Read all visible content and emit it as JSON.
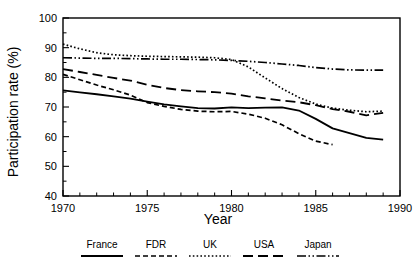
{
  "chart_data": {
    "type": "line",
    "title": "",
    "xlabel": "Year",
    "ylabel": "Participation rate (%)",
    "xlim": [
      1970,
      1990
    ],
    "ylim": [
      40,
      100
    ],
    "grid": false,
    "legend_position": "bottom",
    "x_major_ticks": [
      1970,
      1975,
      1980,
      1985,
      1990
    ],
    "x_major_tick_labels": [
      "1970",
      "1975",
      "1980",
      "1985",
      "1990"
    ],
    "x_minor_tick_step": 1,
    "y_major_ticks": [
      40,
      50,
      60,
      70,
      80,
      90,
      100
    ],
    "y_major_tick_labels": [
      "40",
      "50",
      "60",
      "70",
      "80",
      "90",
      "100"
    ],
    "y_minor_tick_step": 5,
    "series": [
      {
        "name": "France",
        "dash_style": "solid",
        "stroke_width": 1.8,
        "dasharray": "",
        "x": [
          1970,
          1971,
          1972,
          1973,
          1974,
          1975,
          1976,
          1977,
          1978,
          1979,
          1980,
          1981,
          1982,
          1983,
          1984,
          1985,
          1986,
          1987,
          1988,
          1989
        ],
        "values": [
          75.6,
          74.9,
          74.3,
          73.6,
          72.8,
          71.8,
          70.9,
          70.2,
          69.6,
          69.5,
          69.9,
          69.6,
          69.8,
          69.9,
          68.8,
          66.0,
          62.8,
          61.2,
          59.6,
          59.0
        ]
      },
      {
        "name": "FDR",
        "dash_style": "short-dash",
        "stroke_width": 1.7,
        "dasharray": "5,3",
        "x": [
          1970,
          1971,
          1972,
          1973,
          1974,
          1975,
          1976,
          1977,
          1978,
          1979,
          1980,
          1981,
          1982,
          1983,
          1984,
          1985,
          1986
        ],
        "values": [
          81.0,
          79.2,
          77.4,
          75.8,
          74.0,
          71.5,
          70.2,
          69.2,
          68.6,
          68.4,
          68.5,
          67.6,
          66.2,
          64.0,
          61.0,
          58.5,
          57.3
        ]
      },
      {
        "name": "UK",
        "dash_style": "dotted",
        "stroke_width": 1.7,
        "dasharray": "1.6,2.2",
        "x": [
          1970,
          1971,
          1972,
          1973,
          1974,
          1975,
          1976,
          1977,
          1978,
          1979,
          1980,
          1981,
          1982,
          1983,
          1984,
          1985,
          1986,
          1987,
          1988,
          1989
        ],
        "values": [
          91.2,
          89.6,
          88.3,
          87.6,
          87.3,
          87.1,
          87.0,
          86.9,
          86.8,
          86.6,
          86.0,
          83.5,
          79.8,
          76.2,
          73.2,
          71.0,
          69.6,
          68.9,
          68.4,
          68.6
        ]
      },
      {
        "name": "USA",
        "dash_style": "long-dash",
        "stroke_width": 1.8,
        "dasharray": "10,5",
        "x": [
          1970,
          1971,
          1972,
          1973,
          1974,
          1975,
          1976,
          1977,
          1978,
          1979,
          1980,
          1981,
          1982,
          1983,
          1984,
          1985,
          1986,
          1987,
          1988,
          1989
        ],
        "values": [
          82.8,
          81.8,
          80.8,
          79.8,
          78.9,
          77.5,
          76.4,
          75.7,
          75.3,
          75.0,
          74.5,
          73.6,
          72.9,
          72.2,
          71.6,
          70.6,
          69.3,
          68.4,
          67.2,
          68.0
        ]
      },
      {
        "name": "Japan",
        "dash_style": "dash-dot-dot",
        "stroke_width": 1.7,
        "dasharray": "9,2.5,1.5,2.5,1.5,2.5",
        "x": [
          1970,
          1971,
          1972,
          1973,
          1974,
          1975,
          1976,
          1977,
          1978,
          1979,
          1980,
          1981,
          1982,
          1983,
          1984,
          1985,
          1986,
          1987,
          1988,
          1989
        ],
        "values": [
          86.6,
          86.5,
          86.4,
          86.4,
          86.3,
          86.2,
          86.1,
          86.1,
          86.0,
          85.9,
          85.7,
          85.4,
          85.0,
          84.5,
          84.0,
          83.3,
          82.8,
          82.5,
          82.4,
          82.4
        ]
      }
    ]
  },
  "legend": {
    "entries": [
      {
        "label": "France",
        "key": "France"
      },
      {
        "label": "FDR",
        "key": "FDR"
      },
      {
        "label": "UK",
        "key": "UK"
      },
      {
        "label": "USA",
        "key": "USA"
      },
      {
        "label": "Japan",
        "key": "Japan"
      }
    ]
  }
}
